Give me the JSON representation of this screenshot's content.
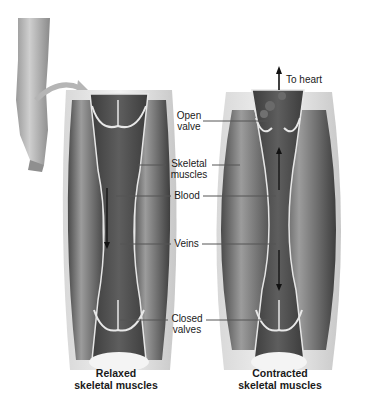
{
  "diagram": {
    "labels": {
      "to_heart": "To heart",
      "open_valve_line1": "Open",
      "open_valve_line2": "valve",
      "skeletal_line1": "Skeletal",
      "skeletal_line2": "muscles",
      "blood": "Blood",
      "veins": "Veins",
      "closed_line1": "Closed",
      "closed_line2": "valves"
    },
    "captions": {
      "left_line1": "Relaxed",
      "left_line2": "skeletal muscles",
      "right_line1": "Contracted",
      "right_line2": "skeletal muscles"
    },
    "panels": [
      {
        "name": "relaxed",
        "state": "Relaxed skeletal muscles",
        "flow": "downward"
      },
      {
        "name": "contracted",
        "state": "Contracted skeletal muscles",
        "flow": "up and down from center"
      }
    ]
  }
}
